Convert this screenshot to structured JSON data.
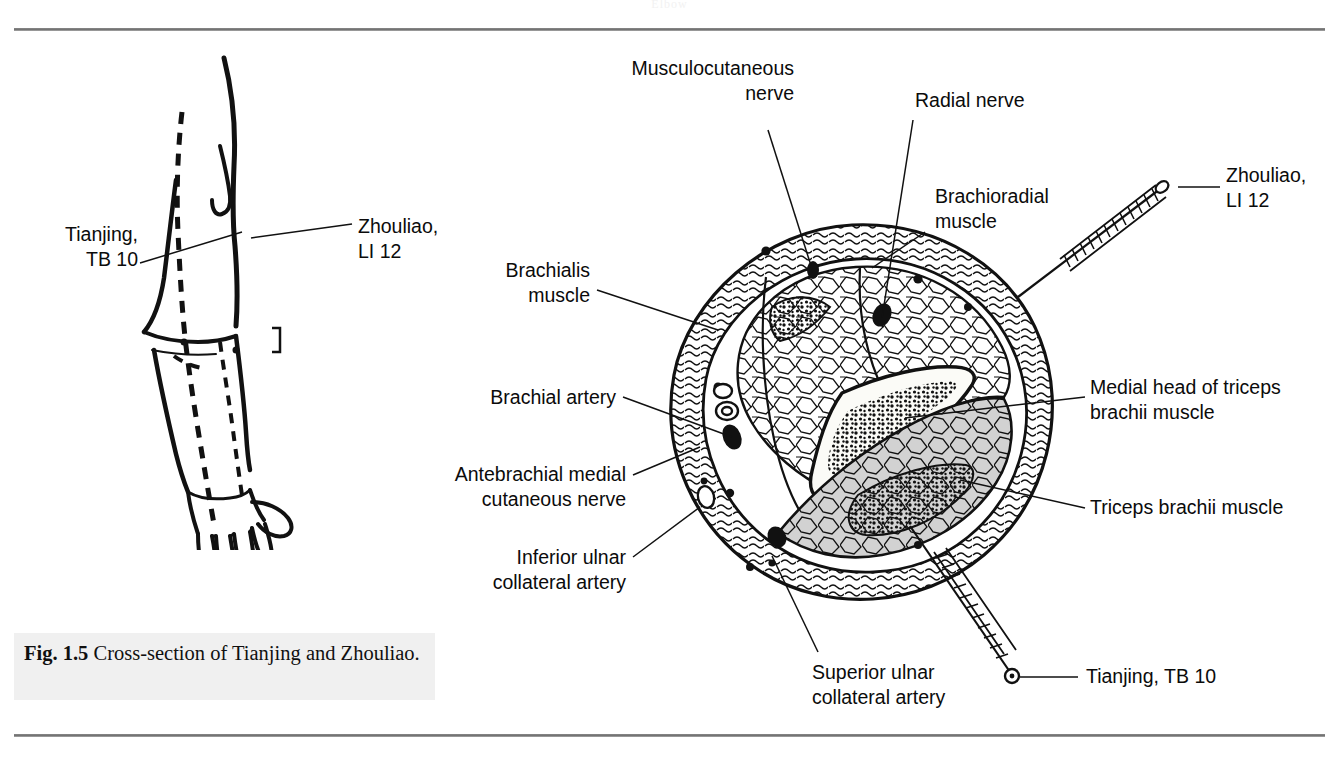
{
  "figure": {
    "caption_label": "Fig. 1.5",
    "caption_text": "Cross-section of Tianjing and Zhouliao.",
    "running_head": "Elbow"
  },
  "arm_diagram": {
    "name": "lateral arm with meridian",
    "labels": [
      {
        "id": "tianjing-left",
        "text": "Tianjing,\nTB 10"
      },
      {
        "id": "zhouliao-left",
        "text": "Zhouliao,\nLI 12"
      }
    ]
  },
  "cross_section": {
    "title": "Cross-section of upper arm",
    "labels": [
      {
        "id": "musculocutaneous-nerve",
        "text": "Musculocutaneous\nnerve",
        "align": "right"
      },
      {
        "id": "radial-nerve",
        "text": "Radial nerve",
        "align": "left"
      },
      {
        "id": "brachioradial-muscle",
        "text": "Brachioradial\nmuscle",
        "align": "left"
      },
      {
        "id": "brachialis-muscle",
        "text": "Brachialis\nmuscle",
        "align": "right"
      },
      {
        "id": "brachial-artery",
        "text": "Brachial artery",
        "align": "right"
      },
      {
        "id": "antebrachial-medial-cutaneous-nerve",
        "text": "Antebrachial medial\ncutaneous nerve",
        "align": "right"
      },
      {
        "id": "inferior-ulnar-collateral-artery",
        "text": "Inferior ulnar\ncollateral artery",
        "align": "right"
      },
      {
        "id": "superior-ulnar-collateral-artery",
        "text": "Superior ulnar\ncollateral artery",
        "align": "left"
      },
      {
        "id": "medial-head-triceps",
        "text": "Medial head of triceps\nbrachii muscle",
        "align": "left"
      },
      {
        "id": "triceps-brachii-muscle",
        "text": "Triceps brachii muscle",
        "align": "left"
      }
    ],
    "needles": [
      {
        "id": "needle-zhouliao",
        "point_label": "Zhouliao,\nLI 12"
      },
      {
        "id": "needle-tianjing",
        "point_label": "Tianjing, TB 10"
      }
    ]
  },
  "colors": {
    "ink": "#0b0b0b",
    "rule": "#7b7b7b",
    "caption_bg": "#f0f0f0",
    "muscle_gray": "#cfcfcf",
    "page_bg": "#ffffff"
  }
}
